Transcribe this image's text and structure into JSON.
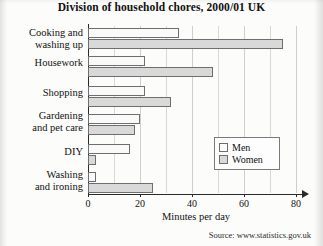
{
  "title": "Division of household chores, 2000/01 UK",
  "source": "Source: www.statistics.gov.uk",
  "legend": {
    "men_label": "Men",
    "women_label": "Women"
  },
  "axis": {
    "xlabel": "Minutes per day",
    "ticks": [
      "0",
      "20",
      "40",
      "60",
      "80"
    ]
  },
  "categories": [
    {
      "line1": "Cooking and",
      "line2": "washing up"
    },
    {
      "line1": "Housework",
      "line2": ""
    },
    {
      "line1": "Shopping",
      "line2": ""
    },
    {
      "line1": "Gardening",
      "line2": "and pet care"
    },
    {
      "line1": "DIY",
      "line2": ""
    },
    {
      "line1": "Washing",
      "line2": "and ironing"
    }
  ],
  "colors": {
    "men": "#fafafa",
    "women": "#d9d9d9",
    "bar_border": "#6e6e6e",
    "axis": "#2a2a2a",
    "grid": "#d8d8d6"
  },
  "chart_data": {
    "type": "bar",
    "orientation": "horizontal",
    "title": "Division of household chores, 2000/01 UK",
    "xlabel": "Minutes per day",
    "ylabel": "",
    "xlim": [
      0,
      85
    ],
    "xticks": [
      0,
      20,
      40,
      60,
      80
    ],
    "grid": true,
    "grid_interval": 10,
    "legend_position": "right-middle",
    "categories": [
      "Cooking and washing up",
      "Housework",
      "Shopping",
      "Gardening and pet care",
      "DIY",
      "Washing and ironing"
    ],
    "series": [
      {
        "name": "Men",
        "values": [
          35,
          22,
          22,
          20,
          16,
          3
        ]
      },
      {
        "name": "Women",
        "values": [
          75,
          48,
          32,
          18,
          3,
          25
        ]
      }
    ]
  }
}
